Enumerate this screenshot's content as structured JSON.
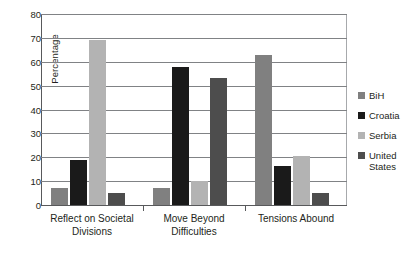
{
  "chart_data": {
    "type": "bar",
    "title": "",
    "xlabel": "",
    "ylabel": "Percentage",
    "ylim": [
      0,
      80
    ],
    "yticks": [
      0,
      10,
      20,
      30,
      40,
      50,
      60,
      70,
      80
    ],
    "grid": "horizontal",
    "legend_position": "right",
    "categories": [
      "Reflect on Societal\nDivisions",
      "Move Beyond\nDifficulties",
      "Tensions Abound"
    ],
    "series": [
      {
        "name": "BiH",
        "color": "#808080",
        "values": [
          7,
          7,
          63
        ]
      },
      {
        "name": "Croatia",
        "color": "#1a1a1a",
        "values": [
          19,
          58,
          16.5
        ]
      },
      {
        "name": "Serbia",
        "color": "#b3b3b3",
        "values": [
          69,
          10,
          20.5
        ]
      },
      {
        "name": "United\nStates",
        "color": "#4d4d4d",
        "values": [
          5,
          53,
          5
        ]
      }
    ]
  }
}
